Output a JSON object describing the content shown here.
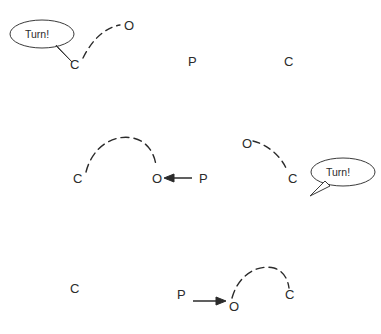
{
  "canvas": {
    "width": 381,
    "height": 334,
    "background": "#ffffff",
    "stroke_color": "#2b2b2b",
    "text_color": "#2b2b2b"
  },
  "labels": {
    "turn": "Turn!",
    "carbon": "C",
    "oxygen": "O",
    "phosphorus": "P"
  },
  "panels": [
    {
      "id": "top-left",
      "atoms": [
        {
          "symbol": "C",
          "x": 70,
          "y": 58
        },
        {
          "symbol": "O",
          "x": 124,
          "y": 19
        }
      ],
      "bubble": {
        "text": "Turn!",
        "x": 10,
        "y": 20,
        "rx": 32,
        "ry": 14
      },
      "arrow": null
    },
    {
      "id": "top-middle",
      "atoms": [
        {
          "symbol": "P",
          "x": 188,
          "y": 55
        }
      ],
      "bubble": null,
      "arrow": null
    },
    {
      "id": "top-right",
      "atoms": [
        {
          "symbol": "C",
          "x": 284,
          "y": 55
        }
      ],
      "bubble": null,
      "arrow": null
    },
    {
      "id": "middle-left",
      "atoms": [
        {
          "symbol": "C",
          "x": 73,
          "y": 172
        },
        {
          "symbol": "O",
          "x": 152,
          "y": 172
        },
        {
          "symbol": "P",
          "x": 199,
          "y": 172
        }
      ],
      "bubble": null,
      "arrow": {
        "direction": "left",
        "from_x": 192,
        "to_x": 166,
        "y": 178
      }
    },
    {
      "id": "middle-right",
      "atoms": [
        {
          "symbol": "O",
          "x": 242,
          "y": 137
        },
        {
          "symbol": "C",
          "x": 288,
          "y": 172
        }
      ],
      "bubble": {
        "text": "Turn!",
        "x": 311,
        "y": 158,
        "rx": 32,
        "ry": 14
      },
      "arrow": null
    },
    {
      "id": "bottom-left",
      "atoms": [
        {
          "symbol": "C",
          "x": 70,
          "y": 282
        }
      ],
      "bubble": null,
      "arrow": null
    },
    {
      "id": "bottom-right",
      "atoms": [
        {
          "symbol": "P",
          "x": 177,
          "y": 288
        },
        {
          "symbol": "O",
          "x": 229,
          "y": 306
        },
        {
          "symbol": "C",
          "x": 285,
          "y": 288
        }
      ],
      "bubble": null,
      "arrow": {
        "direction": "right",
        "from_x": 193,
        "to_x": 224,
        "y": 301
      }
    }
  ],
  "bonds": [
    {
      "id": "top-bond",
      "from": "C",
      "to": "O",
      "style": "dashed"
    },
    {
      "id": "middle-left-bond",
      "from": "C",
      "to": "O",
      "style": "dashed"
    },
    {
      "id": "middle-right-bond",
      "from": "O",
      "to": "C",
      "style": "dashed"
    },
    {
      "id": "bottom-bond",
      "from": "O",
      "to": "C",
      "style": "dashed"
    }
  ]
}
